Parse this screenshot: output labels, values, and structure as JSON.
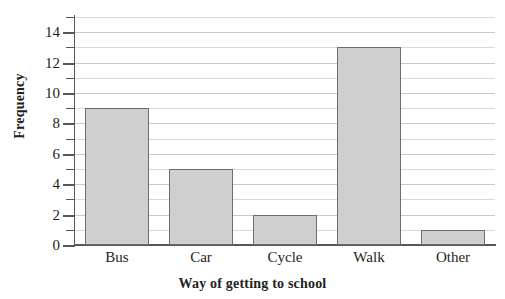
{
  "chart_data": {
    "type": "bar",
    "title": "",
    "xlabel": "Way of getting to school",
    "ylabel": "Frequency",
    "categories": [
      "Bus",
      "Car",
      "Cycle",
      "Walk",
      "Other"
    ],
    "values": [
      9,
      5,
      2,
      13,
      1
    ],
    "ylim": [
      0,
      15
    ],
    "ytick_labels": [
      "0",
      "2",
      "4",
      "6",
      "8",
      "10",
      "12",
      "14"
    ],
    "ytick_values": [
      0,
      2,
      4,
      6,
      8,
      10,
      12,
      14
    ],
    "yminor_values": [
      1,
      3,
      5,
      7,
      9,
      11,
      13,
      15
    ],
    "grid": "horizontal",
    "legend": "none",
    "bar_fill_color": "#cfcfcf",
    "bar_border_color": "#6d6d6d",
    "gridline_color": "#d9d9d9",
    "axis_color": "#575757",
    "text_color": "#231f20"
  }
}
